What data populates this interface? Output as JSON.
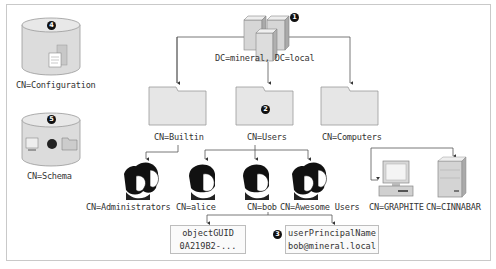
{
  "diagram": {
    "root": {
      "label": "DC=mineral, DC=local",
      "badge": "1",
      "icon": "server-cluster-icon"
    },
    "containers": [
      {
        "label": "CN=Builtin",
        "icon": "folder-icon"
      },
      {
        "label": "CN=Users",
        "icon": "folder-icon",
        "badge": "2"
      },
      {
        "label": "CN=Computers",
        "icon": "folder-icon"
      }
    ],
    "builtin_children": [
      {
        "label": "CN=Administrators",
        "icon": "group-icon"
      }
    ],
    "users_children": [
      {
        "label": "CN=alice",
        "icon": "user-icon"
      },
      {
        "label": "CN=bob",
        "icon": "user-icon"
      },
      {
        "label": "CN=Awesome Users",
        "icon": "group-icon"
      }
    ],
    "computers_children": [
      {
        "label": "CN=GRAPHITE",
        "icon": "workstation-icon"
      },
      {
        "label": "CN=CINNABAR",
        "icon": "server-icon"
      }
    ],
    "bob_attributes": [
      {
        "name": "objectGUID",
        "value": "0A219B2-..."
      },
      {
        "name": "userPrincipalName",
        "value": "bob@mineral.local",
        "badge": "3"
      }
    ],
    "partitions": [
      {
        "label": "CN=Configuration",
        "badge": "4",
        "icon": "database-icon"
      },
      {
        "label": "CN=Schema",
        "badge": "5",
        "icon": "database-icon"
      }
    ]
  }
}
